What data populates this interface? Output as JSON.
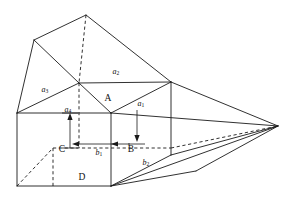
{
  "figure": {
    "background_color": "#ffffff",
    "line_color": "#1a1a1a",
    "vertex_labels": [
      {
        "id": "A",
        "text": "A",
        "x": 108,
        "y": 99
      },
      {
        "id": "B",
        "text": "B",
        "x": 131,
        "y": 150
      },
      {
        "id": "C",
        "text": "C",
        "x": 62,
        "y": 150
      },
      {
        "id": "D",
        "text": "D",
        "x": 82,
        "y": 178
      }
    ],
    "dimension_labels": [
      {
        "id": "a1",
        "base": "a",
        "sub": "1",
        "x": 141,
        "y": 104
      },
      {
        "id": "a2",
        "base": "a",
        "sub": "2",
        "x": 116,
        "y": 72
      },
      {
        "id": "a3",
        "base": "a",
        "sub": "3",
        "x": 45,
        "y": 90
      },
      {
        "id": "a4",
        "base": "a",
        "sub": "4",
        "x": 68,
        "y": 110
      },
      {
        "id": "b1",
        "base": "b",
        "sub": "1",
        "x": 99,
        "y": 153
      },
      {
        "id": "b2",
        "base": "b",
        "sub": "2",
        "x": 146,
        "y": 163
      }
    ],
    "solid_edges": [
      {
        "name": "apex-to-left-upper",
        "points": "86,15 34,40"
      },
      {
        "name": "apex-to-right-top",
        "points": "86,15 171,82"
      },
      {
        "name": "left-upper-to-ridge",
        "points": "34,40 79,83"
      },
      {
        "name": "left-upper-to-left-top",
        "points": "34,40 17,113"
      },
      {
        "name": "ridge-to-a2-right",
        "points": "79,83 171,82"
      },
      {
        "name": "ridge-to-left-top",
        "points": "79,83 17,113"
      },
      {
        "name": "ridge-to-A",
        "points": "79,83 111,113"
      },
      {
        "name": "A-to-a2-right",
        "points": "111,113 171,82"
      },
      {
        "name": "top-face-left-edge",
        "points": "17,113 111,113"
      },
      {
        "name": "cube-left-vertical",
        "points": "17,113 17,186"
      },
      {
        "name": "cube-front-vertical",
        "points": "111,113 111,186"
      },
      {
        "name": "cube-bottom-front",
        "points": "17,186 111,186"
      },
      {
        "name": "right-col-vertical",
        "points": "171,82 171,155"
      },
      {
        "name": "A-to-right-apex",
        "points": "111,113 278,126"
      },
      {
        "name": "right-top-to-apex",
        "points": "171,82 278,126"
      },
      {
        "name": "right-col-bottom-to-apex",
        "points": "171,155 278,126"
      },
      {
        "name": "cube-front-bottom-to-right-apex",
        "points": "111,186 278,126"
      },
      {
        "name": "cube-front-bottom-to-right-col-bottom",
        "points": "111,186 171,155"
      },
      {
        "name": "bottom-wedge-lower",
        "points": "111,186 196,171"
      },
      {
        "name": "bottom-wedge-right",
        "points": "196,171 278,126"
      }
    ],
    "dashed_edges": [
      {
        "name": "apex-vertical-hidden",
        "points": "86,15 79,83"
      },
      {
        "name": "hidden-vertical-through-cube",
        "points": "79,83 79,148"
      },
      {
        "name": "cube-hidden-back-horizontal",
        "points": "53,148 171,148"
      },
      {
        "name": "cube-hidden-back-left-diagonal",
        "points": "17,186 53,148"
      },
      {
        "name": "cube-hidden-back-vertical",
        "points": "53,148 53,186"
      },
      {
        "name": "hidden-right-diagonal",
        "points": "171,148 278,126"
      }
    ],
    "dimension_arrows": [
      {
        "name": "a4-arrow",
        "orientation": "vertical-up",
        "line": "70,148 70,118",
        "head": "70,113 67.4,120 72.6,120"
      },
      {
        "name": "a1-arrow",
        "orientation": "vertical-down",
        "line": "137,110 137,136",
        "head": "137,142 134.4,135 139.6,135"
      },
      {
        "name": "b1-arrow",
        "orientation": "horizontal-left",
        "line": "111,144 78,144",
        "head": "72,144 79,141.4 79,146.6"
      },
      {
        "name": "b1-arrow-right-segment",
        "orientation": "horizontal-right",
        "line": "111,144 130,144",
        "head": "111,144 118,141.4 118,146.6"
      }
    ],
    "guide_ticks": [
      {
        "name": "a4-tick-top",
        "points": "62,113 78,113"
      },
      {
        "name": "a4-tick-bottom",
        "points": "62,148 78,148"
      },
      {
        "name": "a1-tick-bottom",
        "points": "128,144 145,144"
      }
    ]
  }
}
